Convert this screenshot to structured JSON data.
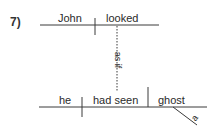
{
  "diagram": {
    "number": "7)",
    "type": "sentence diagram",
    "main_clause": {
      "subject": "John",
      "verb": "looked"
    },
    "connector": "as if",
    "sub_clause": {
      "subject": "he",
      "verb": "had seen",
      "object": "ghost",
      "modifier": "a"
    },
    "colors": {
      "line": "#3a3a3a",
      "text": "#2a2a2a"
    }
  }
}
